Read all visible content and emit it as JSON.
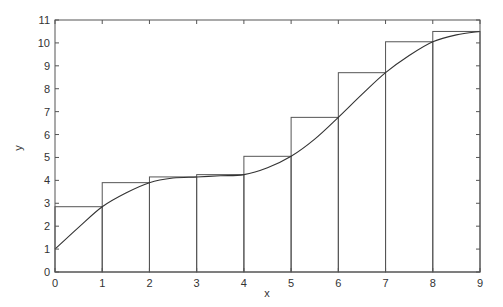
{
  "chart_data": {
    "type": "bar",
    "title": "",
    "xlabel": "x",
    "ylabel": "y",
    "xlim": [
      0,
      9
    ],
    "ylim": [
      0,
      11
    ],
    "grid": false,
    "x_ticks": [
      0,
      1,
      2,
      3,
      4,
      5,
      6,
      7,
      8,
      9
    ],
    "y_ticks": [
      0,
      1,
      2,
      3,
      4,
      5,
      6,
      7,
      8,
      9,
      10,
      11
    ],
    "categories": [
      "[0,1]",
      "[1,2]",
      "[2,3]",
      "[3,4]",
      "[4,5]",
      "[5,6]",
      "[6,7]",
      "[7,8]",
      "[8,9]"
    ],
    "bars": {
      "x_left": [
        0,
        1,
        2,
        3,
        4,
        5,
        6,
        7,
        8
      ],
      "width": 1,
      "values": [
        2.85,
        3.9,
        4.15,
        4.25,
        5.05,
        6.75,
        8.7,
        10.05,
        10.5
      ],
      "description": "Right-endpoint rectangles under the curve"
    },
    "series": [
      {
        "name": "curve",
        "type": "line",
        "x": [
          0,
          0.5,
          1,
          1.5,
          2,
          2.5,
          3,
          3.5,
          4,
          4.5,
          5,
          5.5,
          6,
          6.5,
          7,
          7.5,
          8,
          8.5,
          9
        ],
        "y": [
          1,
          1.95,
          2.85,
          3.45,
          3.9,
          4.1,
          4.15,
          4.2,
          4.25,
          4.55,
          5.05,
          5.8,
          6.75,
          7.75,
          8.7,
          9.45,
          10.05,
          10.35,
          10.5
        ]
      }
    ],
    "colors": {
      "line": "#333333",
      "bars_edge": "#555555",
      "axes": "#555555"
    }
  }
}
